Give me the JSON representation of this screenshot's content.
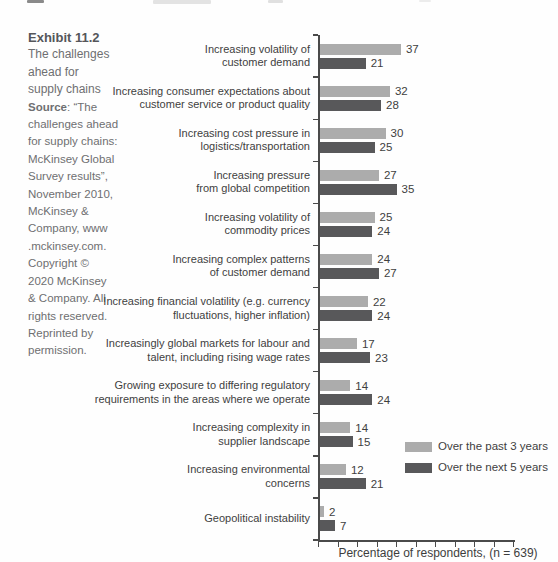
{
  "page": {
    "exhibit_label": "Exhibit 11.2",
    "title_lines": [
      "The challenges",
      "ahead for",
      "supply chains"
    ],
    "source_label": "Source",
    "source_lines": [
      ": “The",
      "challenges ahead",
      "for supply chains:",
      "McKinsey Global",
      "Survey results”,",
      "November 2010,",
      "McKinsey &",
      "Company, www",
      ".mckinsey.com.",
      "Copyright ©",
      "2020 McKinsey",
      "& Company. All",
      "rights reserved.",
      "Reprinted by",
      "permission."
    ]
  },
  "chart_data": {
    "type": "bar",
    "orientation": "horizontal",
    "title": "",
    "xlabel": "Percentage of respondents, (n = 639)",
    "xlim": [
      0,
      90
    ],
    "x_tick_count": 11,
    "x_ticks_labeled": false,
    "grid": false,
    "value_labels": true,
    "legend_position": "right-lower",
    "categories": [
      "Increasing volatility of customer demand",
      "Increasing consumer expectations about customer service or product quality",
      "Increasing cost pressure in logistics/transportation",
      "Increasing pressure from global competition",
      "Increasing volatility of commodity prices",
      "Increasing complex patterns of customer demand",
      "Increasing financial volatility (e.g. currency fluctuations, higher inflation)",
      "Increasingly global markets for labour and talent, including rising wage rates",
      "Growing exposure to differing regulatory requirements in the areas where we operate",
      "Increasing complexity in supplier landscape",
      "Increasing environmental concerns",
      "Geopolitical instability"
    ],
    "category_label_lines": [
      [
        "Increasing volatility of",
        "customer demand"
      ],
      [
        "Increasing consumer expectations about",
        "customer service or product quality"
      ],
      [
        "Increasing cost pressure in",
        "logistics/transportation"
      ],
      [
        "Increasing pressure",
        "from global competition"
      ],
      [
        "Increasing volatility of",
        "commodity prices"
      ],
      [
        "Increasing complex patterns",
        "of customer demand"
      ],
      [
        "Increasing financial volatility (e.g. currency",
        "fluctuations, higher inflation)"
      ],
      [
        "Increasingly global markets for labour and",
        "talent, including rising wage rates"
      ],
      [
        "Growing exposure to differing regulatory",
        "requirements in the areas where we operate"
      ],
      [
        "Increasing complexity in",
        "supplier landscape"
      ],
      [
        "Increasing environmental",
        "concerns"
      ],
      [
        "Geopolitical instability"
      ]
    ],
    "series": [
      {
        "name": "Over the past 3 years",
        "color": "#acacac",
        "values": [
          37,
          32,
          30,
          27,
          25,
          24,
          22,
          17,
          14,
          14,
          12,
          2
        ]
      },
      {
        "name": "Over the next 5 years",
        "color": "#58585a",
        "values": [
          21,
          28,
          25,
          35,
          24,
          27,
          24,
          23,
          24,
          15,
          21,
          7
        ]
      }
    ]
  }
}
